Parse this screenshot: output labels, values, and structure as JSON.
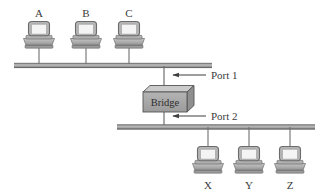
{
  "diagram": {
    "type": "network-topology",
    "colors": {
      "background": "#ffffff",
      "bus_line": "#8c8c8c",
      "bus_line_dark": "#5e5e5e",
      "drop_line": "#6f6f6f",
      "device_body": "#b5b5b5",
      "device_body_dark": "#9a9a9a",
      "device_screen": "#f2f2f2",
      "device_outline": "#6b6b6b",
      "bridge_front": "#a8a8a8",
      "bridge_top": "#c9c9c9",
      "bridge_side": "#8f8f8f",
      "bridge_outline": "#555555",
      "text": "#3b3b3b",
      "arrow": "#3f3f3f"
    },
    "segments": [
      {
        "name": "upper-segment",
        "port": "Port 1",
        "bus": {
          "x1": 14,
          "x2": 212,
          "y": 66
        },
        "hosts": [
          {
            "label": "A",
            "x": 39
          },
          {
            "label": "B",
            "x": 86
          },
          {
            "label": "C",
            "x": 129
          }
        ]
      },
      {
        "name": "lower-segment",
        "port": "Port 2",
        "bus": {
          "x1": 117,
          "x2": 315,
          "y": 127
        },
        "hosts": [
          {
            "label": "X",
            "x": 208
          },
          {
            "label": "Y",
            "x": 249
          },
          {
            "label": "Z",
            "x": 290
          }
        ]
      }
    ],
    "bridge": {
      "label": "Bridge",
      "x": 143,
      "y": 88,
      "width": 44,
      "height": 26,
      "depth": 7
    },
    "ports": [
      {
        "id": "port-1",
        "label": "Port 1",
        "label_x": 211,
        "label_y": 79,
        "arrow_from_x": 206,
        "arrow_to_x": 171,
        "arrow_y": 75
      },
      {
        "id": "port-2",
        "label": "Port 2",
        "label_x": 211,
        "label_y": 120,
        "arrow_from_x": 206,
        "arrow_to_x": 171,
        "arrow_y": 116
      }
    ],
    "labels": {
      "host_a": "A",
      "host_b": "B",
      "host_c": "C",
      "host_x": "X",
      "host_y": "Y",
      "host_z": "Z",
      "bridge": "Bridge",
      "port_1": "Port 1",
      "port_2": "Port 2"
    }
  }
}
